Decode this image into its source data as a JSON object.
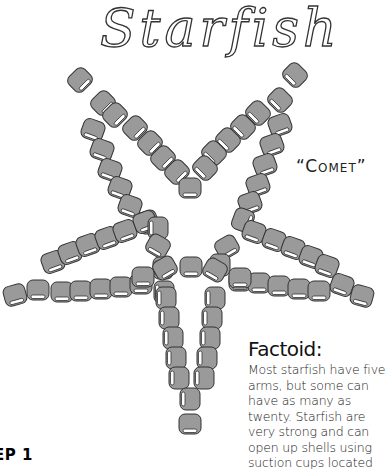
{
  "title": "Starfish",
  "subtitle": "“Comet”",
  "factoid": {
    "heading": "Factoid:",
    "body": "Most starfish have five arms, but some can have as many as twenty.  Starfish are very strong and can open up shells using suction cups located"
  },
  "step_label": "EP 1",
  "colors": {
    "bead_fill": "#9a9a9a",
    "bead_stroke": "#333333",
    "bead_hole": "#ffffff",
    "text": "#222222"
  },
  "star": {
    "arms": [
      {
        "name": "upper-left",
        "beads": [
          [
            80,
            80,
            -45
          ],
          [
            103,
            103,
            -45
          ],
          [
            93,
            130,
            20
          ],
          [
            102,
            150,
            20
          ],
          [
            110,
            170,
            20
          ],
          [
            120,
            188,
            20
          ],
          [
            130,
            206,
            20
          ],
          [
            148,
            222,
            70
          ],
          [
            115,
            115,
            -45
          ],
          [
            135,
            128,
            -45
          ],
          [
            150,
            143,
            -45
          ],
          [
            163,
            158,
            -45
          ],
          [
            177,
            172,
            -45
          ],
          [
            190,
            188,
            0
          ]
        ]
      },
      {
        "name": "upper-right",
        "beads": [
          [
            295,
            75,
            45
          ],
          [
            280,
            100,
            45
          ],
          [
            280,
            125,
            -20
          ],
          [
            272,
            145,
            -20
          ],
          [
            265,
            165,
            -20
          ],
          [
            258,
            185,
            -20
          ],
          [
            250,
            203,
            -20
          ],
          [
            243,
            220,
            -70
          ],
          [
            258,
            113,
            45
          ],
          [
            243,
            127,
            45
          ],
          [
            228,
            140,
            45
          ],
          [
            214,
            153,
            45
          ],
          [
            205,
            168,
            45
          ]
        ]
      },
      {
        "name": "left",
        "beads": [
          [
            15,
            295,
            -15
          ],
          [
            38,
            290,
            0
          ],
          [
            53,
            262,
            -20
          ],
          [
            70,
            253,
            -20
          ],
          [
            88,
            245,
            -20
          ],
          [
            107,
            238,
            -20
          ],
          [
            125,
            231,
            -20
          ],
          [
            145,
            222,
            -20
          ],
          [
            158,
            228,
            90
          ],
          [
            62,
            292,
            0
          ],
          [
            81,
            291,
            0
          ],
          [
            101,
            289,
            0
          ],
          [
            121,
            287,
            0
          ],
          [
            141,
            284,
            0
          ],
          [
            158,
            246,
            30
          ],
          [
            163,
            268,
            90
          ],
          [
            164,
            292,
            90
          ]
        ]
      },
      {
        "name": "right",
        "beads": [
          [
            254,
            232,
            20
          ],
          [
            274,
            240,
            20
          ],
          [
            293,
            248,
            20
          ],
          [
            311,
            257,
            20
          ],
          [
            327,
            266,
            20
          ],
          [
            342,
            285,
            20
          ],
          [
            362,
            296,
            15
          ],
          [
            240,
            281,
            0
          ],
          [
            259,
            283,
            0
          ],
          [
            279,
            286,
            0
          ],
          [
            299,
            289,
            0
          ],
          [
            319,
            291,
            0
          ],
          [
            227,
            247,
            -30
          ],
          [
            220,
            265,
            90
          ]
        ]
      },
      {
        "name": "bottom",
        "beads": [
          [
            143,
            277,
            0
          ],
          [
            165,
            268,
            -30
          ],
          [
            191,
            267,
            0
          ],
          [
            215,
            270,
            30
          ],
          [
            240,
            278,
            0
          ],
          [
            166,
            298,
            90
          ],
          [
            169,
            318,
            90
          ],
          [
            173,
            338,
            90
          ],
          [
            176,
            358,
            90
          ],
          [
            179,
            378,
            90
          ],
          [
            215,
            298,
            90
          ],
          [
            212,
            318,
            90
          ],
          [
            210,
            338,
            90
          ],
          [
            207,
            358,
            90
          ],
          [
            204,
            378,
            90
          ],
          [
            190,
            399,
            90
          ],
          [
            190,
            424,
            0
          ]
        ]
      }
    ]
  }
}
